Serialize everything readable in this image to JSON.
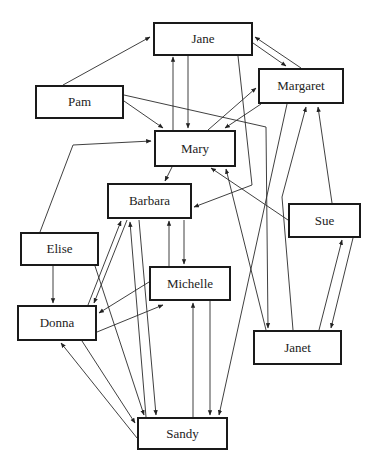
{
  "diagram": {
    "type": "sociogram",
    "nodes": [
      {
        "id": "jane",
        "label": "Jane",
        "x": 153,
        "y": 22,
        "w": 100,
        "h": 34
      },
      {
        "id": "margaret",
        "label": "Margaret",
        "x": 258,
        "y": 68,
        "w": 86,
        "h": 36
      },
      {
        "id": "pam",
        "label": "Pam",
        "x": 35,
        "y": 85,
        "w": 89,
        "h": 34
      },
      {
        "id": "mary",
        "label": "Mary",
        "x": 154,
        "y": 130,
        "w": 82,
        "h": 37
      },
      {
        "id": "barbara",
        "label": "Barbara",
        "x": 107,
        "y": 183,
        "w": 85,
        "h": 36
      },
      {
        "id": "sue",
        "label": "Sue",
        "x": 288,
        "y": 203,
        "w": 73,
        "h": 35
      },
      {
        "id": "elise",
        "label": "Elise",
        "x": 20,
        "y": 232,
        "w": 79,
        "h": 34
      },
      {
        "id": "michelle",
        "label": "Michelle",
        "x": 149,
        "y": 266,
        "w": 82,
        "h": 35
      },
      {
        "id": "donna",
        "label": "Donna",
        "x": 17,
        "y": 305,
        "w": 80,
        "h": 36
      },
      {
        "id": "janet",
        "label": "Janet",
        "x": 253,
        "y": 330,
        "w": 89,
        "h": 35
      },
      {
        "id": "sandy",
        "label": "Sandy",
        "x": 137,
        "y": 417,
        "w": 91,
        "h": 33
      }
    ],
    "edges": [
      {
        "from": "pam",
        "to": "jane",
        "points": [
          [
            63,
            85
          ],
          [
            150,
            37
          ]
        ]
      },
      {
        "from": "pam",
        "to": "mary",
        "points": [
          [
            124,
            101
          ],
          [
            163,
            128
          ]
        ]
      },
      {
        "from": "pam",
        "to": "janet",
        "points": [
          [
            124,
            95
          ],
          [
            266,
            127
          ],
          [
            268,
            328
          ]
        ]
      },
      {
        "from": "mary",
        "to": "jane",
        "points": [
          [
            173,
            130
          ],
          [
            173,
            57
          ]
        ]
      },
      {
        "from": "jane",
        "to": "mary",
        "points": [
          [
            188,
            56
          ],
          [
            188,
            128
          ]
        ]
      },
      {
        "from": "jane",
        "to": "margaret",
        "points": [
          [
            253,
            43
          ],
          [
            286,
            66
          ]
        ]
      },
      {
        "from": "margaret",
        "to": "jane",
        "points": [
          [
            301,
            68
          ],
          [
            255,
            37
          ]
        ]
      },
      {
        "from": "jane",
        "to": "barbara",
        "points": [
          [
            238,
            56
          ],
          [
            252,
            185
          ],
          [
            194,
            207
          ]
        ]
      },
      {
        "from": "mary",
        "to": "margaret",
        "points": [
          [
            208,
            130
          ],
          [
            256,
            88
          ]
        ]
      },
      {
        "from": "margaret",
        "to": "mary",
        "points": [
          [
            261,
            104
          ],
          [
            225,
            128
          ]
        ]
      },
      {
        "from": "margaret",
        "to": "sandy",
        "points": [
          [
            287,
            104
          ],
          [
            219,
            415
          ]
        ]
      },
      {
        "from": "janet",
        "to": "margaret",
        "points": [
          [
            293,
            330
          ],
          [
            282,
            197
          ],
          [
            306,
            107
          ]
        ]
      },
      {
        "from": "sue",
        "to": "margaret",
        "points": [
          [
            332,
            203
          ],
          [
            318,
            107
          ]
        ]
      },
      {
        "from": "sue",
        "to": "mary",
        "points": [
          [
            288,
            220
          ],
          [
            211,
            168
          ]
        ]
      },
      {
        "from": "janet",
        "to": "mary",
        "points": [
          [
            266,
            330
          ],
          [
            226,
            169
          ]
        ]
      },
      {
        "from": "sue",
        "to": "janet",
        "points": [
          [
            353,
            238
          ],
          [
            331,
            328
          ]
        ]
      },
      {
        "from": "janet",
        "to": "sue",
        "points": [
          [
            319,
            330
          ],
          [
            342,
            240
          ]
        ]
      },
      {
        "from": "elise",
        "to": "mary",
        "points": [
          [
            40,
            232
          ],
          [
            73,
            145
          ],
          [
            151,
            141
          ]
        ]
      },
      {
        "from": "mary",
        "to": "barbara",
        "points": [
          [
            172,
            167
          ],
          [
            165,
            181
          ]
        ]
      },
      {
        "from": "elise",
        "to": "donna",
        "points": [
          [
            53,
            266
          ],
          [
            53,
            303
          ]
        ]
      },
      {
        "from": "elise",
        "to": "sandy",
        "points": [
          [
            95,
            266
          ],
          [
            144,
            415
          ]
        ]
      },
      {
        "from": "donna",
        "to": "barbara",
        "points": [
          [
            88,
            305
          ],
          [
            121,
            221
          ]
        ]
      },
      {
        "from": "barbara",
        "to": "donna",
        "points": [
          [
            127,
            220
          ],
          [
            94,
            303
          ]
        ]
      },
      {
        "from": "barbara",
        "to": "sandy",
        "points": [
          [
            139,
            220
          ],
          [
            156,
            415
          ]
        ]
      },
      {
        "from": "sandy",
        "to": "barbara",
        "points": [
          [
            146,
            417
          ],
          [
            130,
            222
          ]
        ]
      },
      {
        "from": "michelle",
        "to": "barbara",
        "points": [
          [
            169,
            266
          ],
          [
            169,
            221
          ]
        ]
      },
      {
        "from": "barbara",
        "to": "michelle",
        "points": [
          [
            184,
            220
          ],
          [
            184,
            264
          ]
        ]
      },
      {
        "from": "michelle",
        "to": "donna",
        "points": [
          [
            149,
            282
          ],
          [
            99,
            313
          ]
        ]
      },
      {
        "from": "donna",
        "to": "michelle",
        "points": [
          [
            97,
            332
          ],
          [
            163,
            305
          ]
        ]
      },
      {
        "from": "michelle",
        "to": "sandy",
        "points": [
          [
            210,
            301
          ],
          [
            210,
            415
          ]
        ]
      },
      {
        "from": "sandy",
        "to": "michelle",
        "points": [
          [
            193,
            417
          ],
          [
            193,
            303
          ]
        ]
      },
      {
        "from": "donna",
        "to": "sandy",
        "points": [
          [
            82,
            341
          ],
          [
            135,
            423
          ]
        ]
      },
      {
        "from": "sandy",
        "to": "donna",
        "points": [
          [
            137,
            438
          ],
          [
            61,
            343
          ]
        ]
      }
    ]
  }
}
